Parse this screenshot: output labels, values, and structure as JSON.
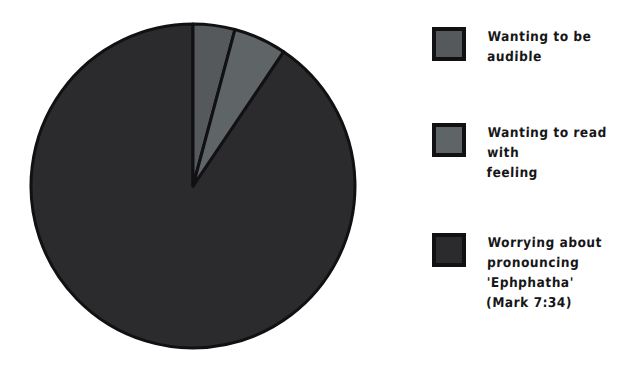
{
  "chart_data": {
    "type": "pie",
    "title": "",
    "subtitle": "",
    "xlabel": "",
    "ylabel": "",
    "grid": false,
    "legend_position": "right",
    "start_angle_deg": 90,
    "direction": "clockwise",
    "categories": [
      "Wanting to be audible",
      "Wanting to read with feeling",
      "Worrying about pronouncing 'Ephphatha' (Mark 7:34)"
    ],
    "values": [
      4.2,
      5.3,
      90.5
    ],
    "angles_deg": [
      15,
      19,
      326
    ],
    "colors": [
      "#55595b",
      "#5f6466",
      "#2b2b2d"
    ],
    "edge_color": "#111113",
    "edge_width": 3,
    "annotations": []
  },
  "legend": {
    "items": [
      {
        "label": "Wanting to be audible",
        "color": "#55595b",
        "swatch_name": "legend-swatch-audible"
      },
      {
        "label": "Wanting to read with\nfeeling",
        "color": "#5f6466",
        "swatch_name": "legend-swatch-feeling"
      },
      {
        "label": "Worrying about\npronouncing 'Ephphatha'\n(Mark 7:34)",
        "color": "#2b2b2d",
        "swatch_name": "legend-swatch-worrying"
      }
    ]
  },
  "figure": {
    "background": "#ffffff",
    "pie_center_x": 173,
    "pie_center_y": 178,
    "pie_radius": 162
  }
}
